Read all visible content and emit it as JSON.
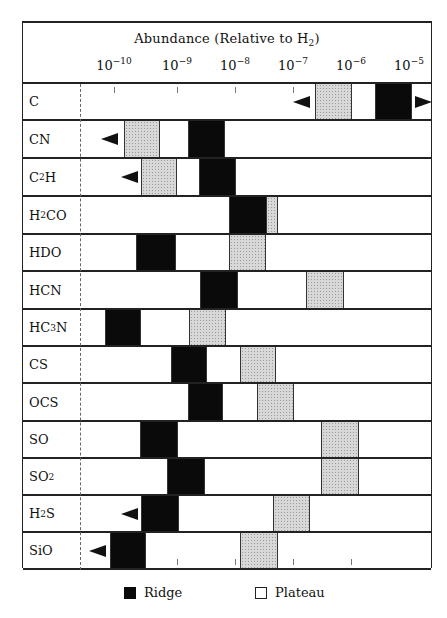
{
  "chart_data": {
    "type": "table",
    "subtype": "range-bar",
    "title": "Abundance (Relative to H2)",
    "xlabel": "Abundance (Relative to H2)",
    "x_scale": "log10",
    "x_ticks": [
      "10^-10",
      "10^-9",
      "10^-8",
      "10^-7",
      "10^-6",
      "10^-5"
    ],
    "x_tick_exponents": [
      -10,
      -9,
      -8,
      -7,
      -6,
      -5
    ],
    "legend": [
      {
        "name": "Ridge",
        "fill": "#0a0a0a"
      },
      {
        "name": "Plateau",
        "fill": "stippled grey"
      }
    ],
    "legend_position": "bottom",
    "series": [
      {
        "molecule": "C",
        "label_main": "C",
        "label_sub": "",
        "label_tail": "",
        "ridge_log": [
          -5.6,
          -5.0
        ],
        "plateau_log": [
          -6.6,
          -6.0
        ],
        "upper_limit_arrow_log": -6.7,
        "lower_limit_arrow_right": true
      },
      {
        "molecule": "CN",
        "label_main": "CN",
        "label_sub": "",
        "label_tail": "",
        "ridge_log": [
          -8.8,
          -8.2
        ],
        "plateau_log": [
          -9.8,
          -9.2
        ],
        "arrow_left_log": -10.1
      },
      {
        "molecule": "C2H",
        "label_main": "C",
        "label_sub": "2",
        "label_tail": "H",
        "ridge_log": [
          -8.6,
          -8.0
        ],
        "plateau_log": [
          -9.6,
          -9.0
        ],
        "arrow_left_log": -9.8
      },
      {
        "molecule": "H2CO",
        "label_main": "H",
        "label_sub": "2",
        "label_tail": "CO",
        "ridge_log": [
          -8.1,
          -7.5
        ],
        "plateau_log": [
          -7.5,
          -7.3
        ]
      },
      {
        "molecule": "HDO",
        "label_main": "HDO",
        "label_sub": "",
        "label_tail": "",
        "ridge_log": [
          -9.7,
          -9.0
        ],
        "plateau_log": [
          -8.1,
          -7.5
        ]
      },
      {
        "molecule": "HCN",
        "label_main": "HCN",
        "label_sub": "",
        "label_tail": "",
        "ridge_log": [
          -8.6,
          -8.0
        ],
        "plateau_log": [
          -6.8,
          -6.1
        ]
      },
      {
        "molecule": "HC3N",
        "label_main": "HC",
        "label_sub": "3",
        "label_tail": "N",
        "ridge_log": [
          -10.2,
          -9.6
        ],
        "plateau_log": [
          -9.0,
          -8.4
        ]
      },
      {
        "molecule": "CS",
        "label_main": "CS",
        "label_sub": "",
        "label_tail": "",
        "ridge_log": [
          -9.1,
          -8.5
        ],
        "plateau_log": [
          -7.9,
          -7.3
        ]
      },
      {
        "molecule": "OCS",
        "label_main": "OCS",
        "label_sub": "",
        "label_tail": "",
        "ridge_log": [
          -8.8,
          -8.2
        ],
        "plateau_log": [
          -7.6,
          -7.0
        ]
      },
      {
        "molecule": "SO",
        "label_main": "SO",
        "label_sub": "",
        "label_tail": "",
        "ridge_log": [
          -9.6,
          -9.0
        ],
        "plateau_log": [
          -6.5,
          -5.8
        ]
      },
      {
        "molecule": "SO2",
        "label_main": "SO",
        "label_sub": "2",
        "label_tail": "",
        "ridge_log": [
          -9.2,
          -8.5
        ],
        "plateau_log": [
          -6.5,
          -5.8
        ]
      },
      {
        "molecule": "H2S",
        "label_main": "H",
        "label_sub": "2",
        "label_tail": "S",
        "ridge_log": [
          -9.6,
          -9.0
        ],
        "plateau_log": [
          -7.4,
          -6.8
        ],
        "arrow_left_log": -9.8
      },
      {
        "molecule": "SiO",
        "label_main": "SiO",
        "label_sub": "",
        "label_tail": "",
        "ridge_log": [
          -10.1,
          -9.5
        ],
        "plateau_log": [
          -7.9,
          -7.3
        ],
        "arrow_left_log": -10.3
      }
    ]
  },
  "header": {
    "title_main": "Abundance (Relative to H",
    "title_sub": "2",
    "title_tail": ")",
    "ticks": [
      {
        "base": "10",
        "exp": "−10",
        "x": 91
      },
      {
        "base": "10",
        "exp": "−9",
        "x": 154
      },
      {
        "base": "10",
        "exp": "−8",
        "x": 212
      },
      {
        "base": "10",
        "exp": "−7",
        "x": 270
      },
      {
        "base": "10",
        "exp": "−6",
        "x": 328
      },
      {
        "base": "10",
        "exp": "−5",
        "x": 386
      }
    ]
  },
  "rows_px": [
    {
      "top": 61,
      "h": 37,
      "ridge": [
        352,
        388
      ],
      "plateau": [
        292,
        329
      ],
      "seps": [],
      "arrow_left": 270,
      "arrow_right": 392
    },
    {
      "top": 98,
      "h": 38,
      "ridge": [
        165,
        201
      ],
      "plateau": [
        101,
        137
      ],
      "seps": [
        165
      ],
      "arrow_left": 78
    },
    {
      "top": 136,
      "h": 38,
      "ridge": [
        176,
        212
      ],
      "plateau": [
        118,
        154
      ],
      "seps": [
        176
      ],
      "arrow_left": 98
    },
    {
      "top": 174,
      "h": 38,
      "ridge": [
        206,
        243
      ],
      "plateau": [
        243,
        255
      ],
      "seps": []
    },
    {
      "top": 212,
      "h": 37,
      "ridge": [
        113,
        152
      ],
      "plateau": [
        206,
        243
      ],
      "seps": []
    },
    {
      "top": 249,
      "h": 38,
      "ridge": [
        177,
        214
      ],
      "plateau": [
        283,
        321
      ],
      "seps": []
    },
    {
      "top": 287,
      "h": 37,
      "ridge": [
        82,
        117
      ],
      "plateau": [
        166,
        203
      ],
      "seps": []
    },
    {
      "top": 324,
      "h": 37,
      "ridge": [
        148,
        183
      ],
      "plateau": [
        217,
        253
      ],
      "seps": []
    },
    {
      "top": 361,
      "h": 38,
      "ridge": [
        165,
        199
      ],
      "plateau": [
        234,
        271
      ],
      "seps": []
    },
    {
      "top": 399,
      "h": 37,
      "ridge": [
        117,
        154
      ],
      "plateau": [
        298,
        336
      ],
      "seps": []
    },
    {
      "top": 436,
      "h": 37,
      "ridge": [
        144,
        181
      ],
      "plateau": [
        298,
        336
      ],
      "seps": []
    },
    {
      "top": 473,
      "h": 37,
      "ridge": [
        118,
        155
      ],
      "plateau": [
        250,
        287
      ],
      "seps": [],
      "arrow_left": 98
    },
    {
      "top": 510,
      "h": 37,
      "ridge": [
        87,
        122
      ],
      "plateau": [
        217,
        255
      ],
      "seps": [],
      "arrow_left": 66
    }
  ],
  "legend": {
    "ridge_label": "Ridge",
    "plateau_label": "Plateau"
  }
}
